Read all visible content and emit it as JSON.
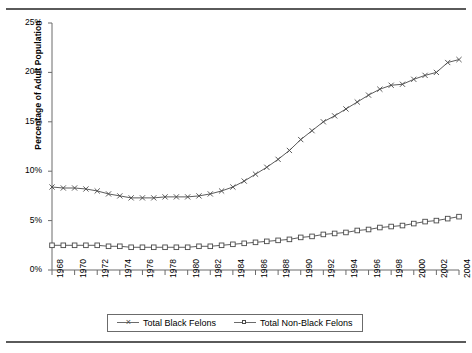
{
  "chart_data": {
    "type": "line",
    "title": "",
    "xlabel": "",
    "ylabel": "Percentage of Adult Population",
    "ylim": [
      0,
      25
    ],
    "xlim": [
      1968,
      2004
    ],
    "grid": false,
    "legend_position": "bottom",
    "ytick_labels": [
      "0%",
      "5%",
      "10%",
      "15%",
      "20%",
      "25%"
    ],
    "ytick_values": [
      0,
      5,
      10,
      15,
      20,
      25
    ],
    "x": [
      1968,
      1969,
      1970,
      1971,
      1972,
      1973,
      1974,
      1975,
      1976,
      1977,
      1978,
      1979,
      1980,
      1981,
      1982,
      1983,
      1984,
      1985,
      1986,
      1987,
      1988,
      1989,
      1990,
      1991,
      1992,
      1993,
      1994,
      1995,
      1996,
      1997,
      1998,
      1999,
      2000,
      2001,
      2002,
      2003,
      2004
    ],
    "xtick_labels": [
      "1968",
      "1970",
      "1972",
      "1974",
      "1976",
      "1978",
      "1980",
      "1982",
      "1984",
      "1986",
      "1988",
      "1990",
      "1992",
      "1994",
      "1996",
      "1998",
      "2000",
      "2002",
      "2004"
    ],
    "xtick_values": [
      1968,
      1970,
      1972,
      1974,
      1976,
      1978,
      1980,
      1982,
      1984,
      1986,
      1988,
      1990,
      1992,
      1994,
      1996,
      1998,
      2000,
      2002,
      2004
    ],
    "series": [
      {
        "name": "Total Black Felons",
        "marker": "x",
        "color": "#4a4a4a",
        "values": [
          8.4,
          8.3,
          8.3,
          8.2,
          8.0,
          7.7,
          7.5,
          7.3,
          7.3,
          7.3,
          7.4,
          7.4,
          7.4,
          7.5,
          7.7,
          8.0,
          8.4,
          9.0,
          9.7,
          10.4,
          11.2,
          12.1,
          13.2,
          14.1,
          15.0,
          15.6,
          16.3,
          17.0,
          17.7,
          18.3,
          18.7,
          18.8,
          19.3,
          19.7,
          20.0,
          21.0,
          21.3
        ]
      },
      {
        "name": "Total Non-Black Felons",
        "marker": "square",
        "color": "#4a4a4a",
        "values": [
          2.5,
          2.5,
          2.5,
          2.5,
          2.5,
          2.4,
          2.4,
          2.3,
          2.3,
          2.3,
          2.3,
          2.3,
          2.3,
          2.4,
          2.4,
          2.5,
          2.6,
          2.7,
          2.8,
          2.9,
          3.0,
          3.1,
          3.3,
          3.4,
          3.6,
          3.7,
          3.8,
          4.0,
          4.1,
          4.3,
          4.4,
          4.5,
          4.7,
          4.9,
          5.0,
          5.2,
          5.4
        ]
      }
    ]
  },
  "legend": {
    "entries": [
      {
        "label": "Total Black Felons"
      },
      {
        "label": "Total Non-Black Felons"
      }
    ]
  }
}
